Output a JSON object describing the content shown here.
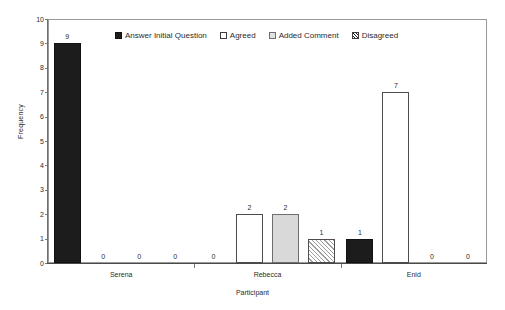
{
  "chart_data": {
    "type": "bar",
    "title": "",
    "xlabel": "Participant",
    "ylabel": "Frequency",
    "categories": [
      "Serena",
      "Rebecca",
      "Enid"
    ],
    "series": [
      {
        "name": "Answer Initial Question",
        "values": [
          9,
          0,
          1
        ],
        "fill": "solid-black",
        "color": "#1c1c1c"
      },
      {
        "name": "Agreed",
        "values": [
          0,
          2,
          7
        ],
        "fill": "white-outline",
        "color": "#ffffff"
      },
      {
        "name": "Added Comment",
        "values": [
          0,
          2,
          0
        ],
        "fill": "light-gray",
        "color": "#d9d9d9"
      },
      {
        "name": "Disagreed",
        "values": [
          0,
          1,
          0
        ],
        "fill": "diagonal-hatch",
        "color": "#ffffff"
      }
    ],
    "ylim": [
      0,
      10
    ],
    "yticks": [
      0,
      1,
      2,
      3,
      4,
      5,
      6,
      7,
      8,
      9,
      10
    ],
    "ytick_labels": [
      "0",
      "1",
      "2",
      "3",
      "4",
      "5",
      "6",
      "7",
      "8",
      "9",
      "10"
    ],
    "grid": false,
    "legend_position": "inside-top",
    "data_labels_shown": true
  },
  "axes": {
    "y_title": "Frequency",
    "x_title": "Participant"
  },
  "legend": {
    "items": [
      {
        "label": "Answer Initial Question"
      },
      {
        "label": "Agreed"
      },
      {
        "label": "Added Comment"
      },
      {
        "label": "Disagreed"
      }
    ]
  },
  "bars": [
    {
      "label": "9",
      "series": "Answer Initial Question",
      "category": "Serena",
      "value": 9
    },
    {
      "label": "0",
      "series": "Agreed",
      "category": "Serena",
      "value": 0
    },
    {
      "label": "0",
      "series": "Added Comment",
      "category": "Serena",
      "value": 0
    },
    {
      "label": "0",
      "series": "Disagreed",
      "category": "Serena",
      "value": 0
    },
    {
      "label": "0",
      "series": "Answer Initial Question",
      "category": "Rebecca",
      "value": 0
    },
    {
      "label": "2",
      "series": "Agreed",
      "category": "Rebecca",
      "value": 2
    },
    {
      "label": "2",
      "series": "Added Comment",
      "category": "Rebecca",
      "value": 2
    },
    {
      "label": "1",
      "series": "Disagreed",
      "category": "Rebecca",
      "value": 1
    },
    {
      "label": "1",
      "series": "Answer Initial Question",
      "category": "Enid",
      "value": 1
    },
    {
      "label": "7",
      "series": "Agreed",
      "category": "Enid",
      "value": 7
    },
    {
      "label": "0",
      "series": "Added Comment",
      "category": "Enid",
      "value": 0
    },
    {
      "label": "0",
      "series": "Disagreed",
      "category": "Enid",
      "value": 0
    }
  ]
}
